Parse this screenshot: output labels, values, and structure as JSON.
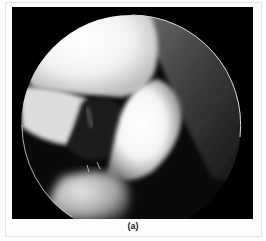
{
  "figure": {
    "caption": "(a)",
    "image_description": "Grayscale arthroscopic view within a circular scope field",
    "colors": {
      "background": "#000000",
      "tissue_bright": "#ffffff",
      "tissue_mid": "#9a9a9a",
      "scope_rim": "#d8d8d8",
      "frame_border": "#e4e4e4"
    }
  }
}
